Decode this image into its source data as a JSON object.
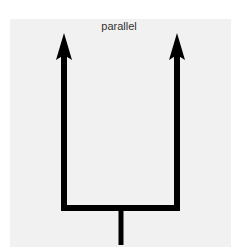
{
  "diagram": {
    "label": "parallel",
    "colors": {
      "background": "#f1f1f1",
      "stroke": "#000000",
      "text": "#333333"
    },
    "shape": "fork with two upward parallel arrows joined by a horizontal bar and a single stem below"
  }
}
